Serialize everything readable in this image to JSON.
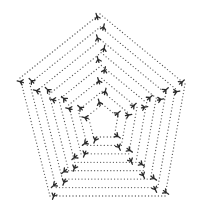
{
  "image": {
    "description": "Hand-drawn style illustration of nested dotted pentagons forming a web, with Y-shaped bird-footprint marks tracing the five spokes from outer vertices toward the center",
    "background": "#ffffff",
    "ink_color": "#2a2a2a",
    "dot_color": "#555555"
  },
  "pentagon": {
    "center": [
      103,
      124
    ],
    "outer_vertices": [
      [
        100,
        14
      ],
      [
        185,
        84
      ],
      [
        165,
        196
      ],
      [
        50,
        196
      ],
      [
        20,
        78
      ]
    ],
    "levels": 8,
    "inner_scale": 0.18
  },
  "footprints": {
    "per_spoke": 9,
    "glyph": "bird-footprint-icon"
  }
}
